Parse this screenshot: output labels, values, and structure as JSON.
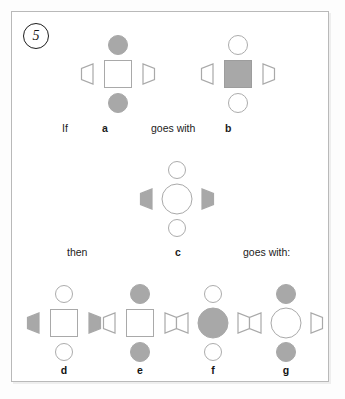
{
  "question": {
    "number": "5",
    "prompt_words": {
      "if": "If",
      "goes_with": "goes with",
      "then": "then",
      "goes_with_colon": "goes with:"
    }
  },
  "colors": {
    "fill_gray": "#a8a8a8",
    "outline_gray": "#a9a9a9",
    "frame_border": "#b9b9b9",
    "text": "#1b1b1b",
    "page_background": "#fdfdfd"
  },
  "figures": [
    {
      "id": "a",
      "label": "a",
      "center": {
        "shape": "square",
        "style": "outline"
      },
      "top": {
        "shape": "circle-small",
        "style": "filled"
      },
      "bottom": {
        "shape": "circle-small",
        "style": "filled"
      },
      "left": {
        "shape": "trapezoid",
        "style": "outline",
        "direction": "left"
      },
      "right": {
        "shape": "trapezoid",
        "style": "outline",
        "direction": "right"
      }
    },
    {
      "id": "b",
      "label": "b",
      "center": {
        "shape": "square",
        "style": "filled"
      },
      "top": {
        "shape": "circle-small",
        "style": "outline"
      },
      "bottom": {
        "shape": "circle-small",
        "style": "outline"
      },
      "left": {
        "shape": "trapezoid",
        "style": "outline",
        "direction": "left"
      },
      "right": {
        "shape": "trapezoid",
        "style": "outline",
        "direction": "right"
      }
    },
    {
      "id": "c",
      "label": "c",
      "center": {
        "shape": "circle-large",
        "style": "outline"
      },
      "top": {
        "shape": "circle-small",
        "style": "outline"
      },
      "bottom": {
        "shape": "circle-small",
        "style": "outline"
      },
      "left": {
        "shape": "trapezoid",
        "style": "filled",
        "direction": "left"
      },
      "right": {
        "shape": "trapezoid",
        "style": "filled",
        "direction": "right"
      }
    },
    {
      "id": "d",
      "label": "d",
      "center": {
        "shape": "square",
        "style": "outline"
      },
      "top": {
        "shape": "circle-small",
        "style": "outline"
      },
      "bottom": {
        "shape": "circle-small",
        "style": "outline"
      },
      "left": {
        "shape": "trapezoid",
        "style": "filled",
        "direction": "left"
      },
      "right": {
        "shape": "trapezoid",
        "style": "filled",
        "direction": "right"
      }
    },
    {
      "id": "e",
      "label": "e",
      "center": {
        "shape": "square",
        "style": "outline"
      },
      "top": {
        "shape": "circle-small",
        "style": "filled"
      },
      "bottom": {
        "shape": "circle-small",
        "style": "filled"
      },
      "left": {
        "shape": "trapezoid",
        "style": "outline",
        "direction": "left"
      },
      "right": {
        "shape": "trapezoid",
        "style": "outline",
        "direction": "right"
      }
    },
    {
      "id": "f",
      "label": "f",
      "center": {
        "shape": "circle-large",
        "style": "filled"
      },
      "top": {
        "shape": "circle-small",
        "style": "outline"
      },
      "bottom": {
        "shape": "circle-small",
        "style": "outline"
      },
      "left": {
        "shape": "trapezoid",
        "style": "outline",
        "direction": "left"
      },
      "right": {
        "shape": "trapezoid",
        "style": "outline",
        "direction": "right"
      }
    },
    {
      "id": "g",
      "label": "g",
      "center": {
        "shape": "circle-large",
        "style": "outline"
      },
      "top": {
        "shape": "circle-small",
        "style": "filled"
      },
      "bottom": {
        "shape": "circle-small",
        "style": "filled"
      },
      "left": {
        "shape": "trapezoid",
        "style": "outline",
        "direction": "left"
      },
      "right": {
        "shape": "trapezoid",
        "style": "outline",
        "direction": "right"
      }
    }
  ]
}
